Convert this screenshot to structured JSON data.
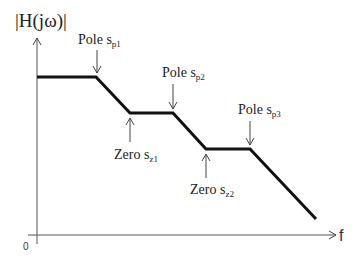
{
  "diagram": {
    "y_axis": {
      "label": "|H(jω)|"
    },
    "x_axis": {
      "label": "f",
      "origin_label": "0"
    },
    "annotations": [
      {
        "id": "pole1",
        "type": "pole",
        "text": "Pole s",
        "sub": "p1",
        "direction": "down"
      },
      {
        "id": "zero1",
        "type": "zero",
        "text": "Zero s",
        "sub": "z1",
        "direction": "up"
      },
      {
        "id": "pole2",
        "type": "pole",
        "text": "Pole s",
        "sub": "p2",
        "direction": "down"
      },
      {
        "id": "zero2",
        "type": "zero",
        "text": "Zero s",
        "sub": "z2",
        "direction": "up"
      },
      {
        "id": "pole3",
        "type": "pole",
        "text": "Pole s",
        "sub": "p3",
        "direction": "down"
      }
    ],
    "response_segments": [
      "flat",
      "roll-off",
      "flat",
      "roll-off",
      "flat",
      "roll-off"
    ],
    "colors": {
      "curve": "#111111",
      "axis": "#555555",
      "text": "#222222"
    }
  }
}
